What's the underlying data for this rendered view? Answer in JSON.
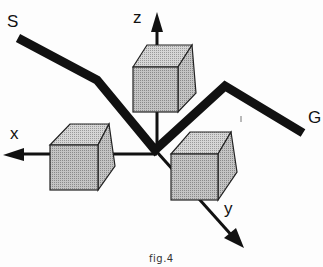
{
  "figure": {
    "caption": "fig.4",
    "labels": {
      "start": "S",
      "goal": "G",
      "x_axis": "x",
      "y_axis": "y",
      "z_axis": "z"
    },
    "path_points": [
      [
        18,
        38
      ],
      [
        97,
        80
      ],
      [
        155,
        150
      ],
      [
        225,
        86
      ],
      [
        303,
        133
      ]
    ],
    "origin": [
      157,
      152
    ],
    "colors": {
      "path": "#111111",
      "cube_fill": "#bdbdbd",
      "cube_top": "#d0d0d0",
      "cube_side": "#a9a9a9",
      "outline": "#222222"
    }
  }
}
